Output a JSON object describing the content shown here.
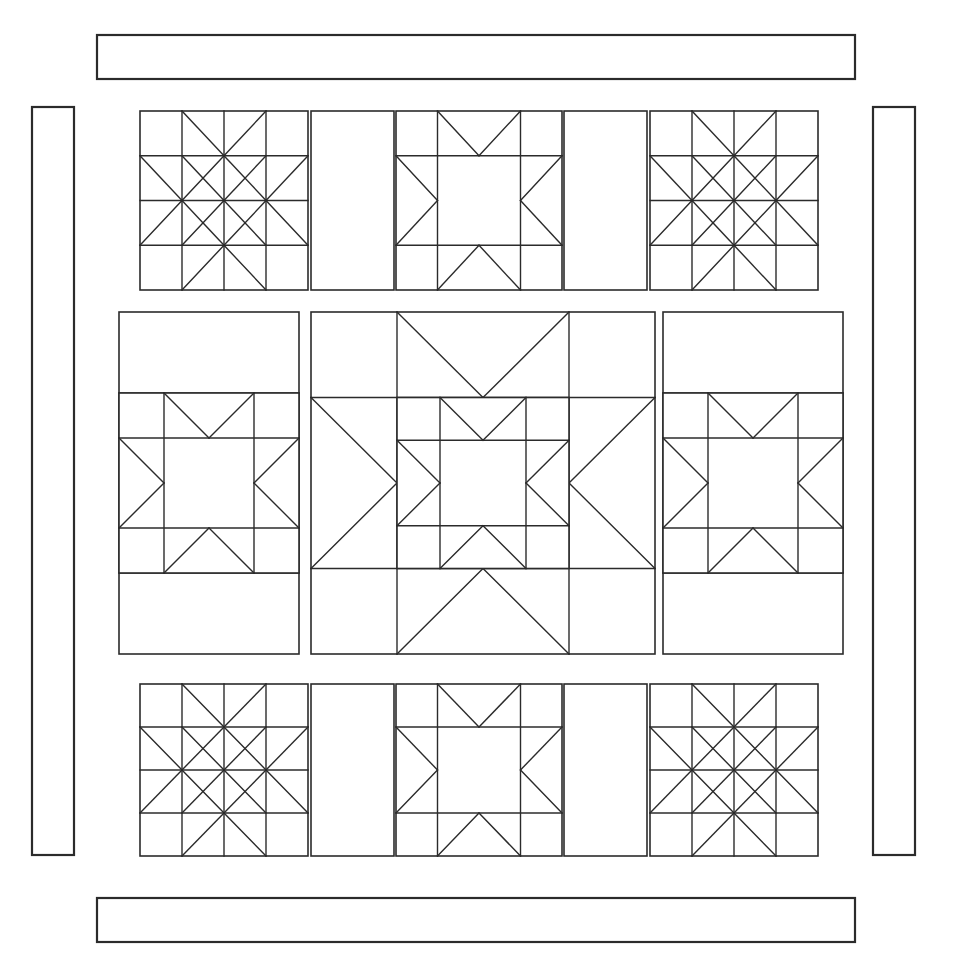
{
  "document": {
    "title": "Quilt Block Layout Diagram",
    "type": "line-art-diagram",
    "watermark_text": ""
  },
  "style": {
    "background_color": "#ffffff",
    "line_color": "#2b2b2b",
    "fill_color": "#ffffff",
    "outer_stroke_width": 2.2,
    "inner_stroke_width": 1.6,
    "patch_stroke_width": 1.4
  },
  "canvas": {
    "width": 962,
    "height": 959
  },
  "layout": {
    "description": "Medallion quilt layout: nine pieced blocks in a 3x3 arrangement, framed by four separate plain border strips (top, bottom, left, right).",
    "field": {
      "x": 119,
      "y": 107,
      "width": 724,
      "height": 748
    },
    "rows": [
      {
        "name": "top-row",
        "y": 110,
        "height": 182
      },
      {
        "name": "middle-row",
        "y": 312,
        "height": 342
      },
      {
        "name": "bottom-row",
        "y": 682,
        "height": 172
      }
    ],
    "columns": [
      {
        "name": "left-column",
        "x": 140,
        "height_note": "narrow"
      },
      {
        "name": "center-column",
        "x": 312,
        "height_note": "wide"
      },
      {
        "name": "right-column",
        "x": 656,
        "height_note": "narrow"
      }
    ]
  },
  "borders": [
    {
      "name": "top-border-strip",
      "x": 97,
      "y": 35,
      "width": 758,
      "height": 44,
      "label": "Top border"
    },
    {
      "name": "bottom-border-strip",
      "x": 97,
      "y": 898,
      "width": 758,
      "height": 44,
      "label": "Bottom border"
    },
    {
      "name": "left-border-strip",
      "x": 32,
      "y": 107,
      "width": 42,
      "height": 748,
      "label": "Left border"
    },
    {
      "name": "right-border-strip",
      "x": 873,
      "y": 107,
      "width": 42,
      "height": 748,
      "label": "Right border"
    }
  ],
  "blocks": [
    {
      "id": "block-top-left",
      "pattern": "eight-pointed-star-with-hourglass",
      "row": 0,
      "col": 0,
      "x": 140,
      "y": 111,
      "width": 168,
      "height": 179
    },
    {
      "id": "sashing-top-left",
      "pattern": "plain-rectangle",
      "row": 0,
      "col": 1,
      "x": 311,
      "y": 111,
      "width": 83,
      "height": 179
    },
    {
      "id": "block-top-center",
      "pattern": "ohio-star",
      "row": 0,
      "col": 2,
      "x": 396,
      "y": 111,
      "width": 166,
      "height": 179
    },
    {
      "id": "sashing-top-right",
      "pattern": "plain-rectangle",
      "row": 0,
      "col": 3,
      "x": 564,
      "y": 111,
      "width": 83,
      "height": 179
    },
    {
      "id": "block-top-right",
      "pattern": "eight-pointed-star-with-hourglass",
      "row": 0,
      "col": 4,
      "x": 650,
      "y": 111,
      "width": 168,
      "height": 179
    },
    {
      "id": "block-middle-left",
      "pattern": "ohio-star-in-tall-rectangle",
      "row": 1,
      "col": 0,
      "x": 119,
      "y": 312,
      "width": 180,
      "height": 342
    },
    {
      "id": "block-middle-center",
      "pattern": "nested-double-ohio-star",
      "row": 1,
      "col": 1,
      "x": 311,
      "y": 312,
      "width": 344,
      "height": 342
    },
    {
      "id": "block-middle-right",
      "pattern": "ohio-star-in-tall-rectangle",
      "row": 1,
      "col": 2,
      "x": 663,
      "y": 312,
      "width": 180,
      "height": 342
    },
    {
      "id": "block-bottom-left",
      "pattern": "eight-pointed-star-with-hourglass",
      "row": 2,
      "col": 0,
      "x": 140,
      "y": 684,
      "width": 168,
      "height": 172
    },
    {
      "id": "sashing-bottom-left",
      "pattern": "plain-rectangle",
      "row": 2,
      "col": 1,
      "x": 311,
      "y": 684,
      "width": 83,
      "height": 172
    },
    {
      "id": "block-bottom-center",
      "pattern": "ohio-star",
      "row": 2,
      "col": 2,
      "x": 396,
      "y": 684,
      "width": 166,
      "height": 172
    },
    {
      "id": "sashing-bottom-right",
      "pattern": "plain-rectangle",
      "row": 2,
      "col": 3,
      "x": 564,
      "y": 684,
      "width": 83,
      "height": 172
    },
    {
      "id": "block-bottom-right",
      "pattern": "eight-pointed-star-with-hourglass",
      "row": 2,
      "col": 4,
      "x": 650,
      "y": 684,
      "width": 168,
      "height": 172
    }
  ]
}
